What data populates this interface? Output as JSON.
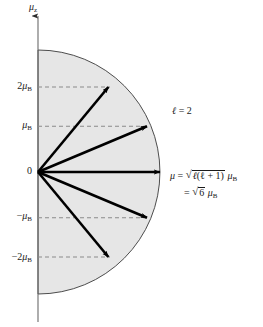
{
  "figure": {
    "type": "vector-model-diagram",
    "title_axis": "μ",
    "axis": {
      "name": "mu-z-axis",
      "label_symbol": "μ",
      "label_subscript": "z",
      "direction": "up",
      "x_px": 38,
      "top_px": 14,
      "bottom_px": 322
    },
    "origin": {
      "label": "0",
      "x_px": 38,
      "y_px": 172
    },
    "semicircle": {
      "name": "mu-magnitude-semicircle",
      "center_x_px": 38,
      "center_y_px": 172,
      "radius_px": 122,
      "fill_color": "#e6e6e6",
      "stroke_color": "#3a3a3a"
    },
    "tick_labels": [
      {
        "id": "plus-2mu-b",
        "text_prefix": "2",
        "symbol": "μ",
        "subscript": "B",
        "value": 2,
        "y_px": 87
      },
      {
        "id": "plus-mu-b",
        "text_prefix": "",
        "symbol": "μ",
        "subscript": "B",
        "value": 1,
        "y_px": 126
      },
      {
        "id": "zero",
        "text_prefix": "0",
        "symbol": "",
        "subscript": "",
        "value": 0,
        "y_px": 172
      },
      {
        "id": "minus-mu-b",
        "text_prefix": "−",
        "symbol": "μ",
        "subscript": "B",
        "value": -1,
        "y_px": 217
      },
      {
        "id": "minus-2mu-b",
        "text_prefix": "−2",
        "symbol": "μ",
        "subscript": "B",
        "value": -2,
        "y_px": 258
      }
    ],
    "dashed_guides": {
      "color": "#8a8a8a",
      "dash": "4,3",
      "levels": [
        2,
        1,
        -1,
        -2
      ]
    },
    "vectors": {
      "name": "angular-momentum-vectors",
      "color": "#000000",
      "count": 5,
      "m_values": [
        2,
        1,
        0,
        -1,
        -2
      ],
      "tips": [
        {
          "m": 2,
          "x_px": 108.4,
          "y_px": 87.0
        },
        {
          "m": 1,
          "x_px": 147.0,
          "y_px": 126.2
        },
        {
          "m": 0,
          "x_px": 160.0,
          "y_px": 172.0
        },
        {
          "m": -1,
          "x_px": 147.0,
          "y_px": 217.8
        },
        {
          "m": -2,
          "x_px": 108.4,
          "y_px": 257.0
        }
      ]
    },
    "annotations": {
      "quantum_number": {
        "name": "ell-equals-2",
        "symbol": "ℓ",
        "equals": "= 2",
        "x_px": 172,
        "y_px": 112
      },
      "magnitude_formula": {
        "name": "mu-magnitude-formula",
        "x_px": 172,
        "y_px": 176,
        "line1": {
          "lhs": "μ",
          "eq": "=",
          "radicand_ell": "ℓ",
          "radicand_rest": "(ℓ + 1)",
          "unit_symbol": "μ",
          "unit_subscript": "B"
        },
        "line2": {
          "eq": "=",
          "radicand": "6",
          "unit_symbol": "μ",
          "unit_subscript": "B"
        }
      }
    }
  }
}
